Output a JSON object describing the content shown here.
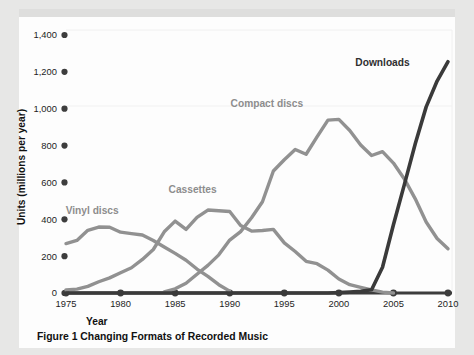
{
  "figure": {
    "caption_label": "Figure 1",
    "caption_text": "Changing Formats of Recorded Music",
    "caption_full": "Figure 1  Changing Formats of Recorded Music"
  },
  "colors": {
    "page_background": "#e7e7e6",
    "card_background": "#fdfdfd",
    "gray_series": "#919191",
    "dark_series": "#3a3a3a",
    "axis": "#3d3d3d",
    "label_gray": "#8d8d8d",
    "label_dark": "#2f2f2f",
    "text": "#1d1d1d",
    "gridline": "#ececec"
  },
  "chart_data": {
    "type": "line",
    "title": "Figure 1  Changing Formats of Recorded Music",
    "xlabel": "Year",
    "ylabel": "Units (millions per year)",
    "xlim": [
      1975,
      2010
    ],
    "ylim": [
      0,
      1400
    ],
    "xticks": [
      1975,
      1980,
      1985,
      1990,
      1995,
      2000,
      2005,
      2010
    ],
    "xtick_labels": [
      "1975",
      "1980",
      "1985",
      "1990",
      "1995",
      "2000",
      "2005",
      "2010"
    ],
    "yticks": [
      0,
      200,
      400,
      600,
      800,
      1000,
      1200,
      1400
    ],
    "ytick_labels": [
      "0",
      "200",
      "400",
      "600",
      "800",
      "1,000",
      "1,200",
      "1,400"
    ],
    "grid": false,
    "legend": "inline-labels",
    "series": [
      {
        "name": "Vinyl discs",
        "color": "#919191",
        "label_x": 1977.4,
        "label_y": 430,
        "x": [
          1975,
          1976,
          1977,
          1978,
          1979,
          1980,
          1981,
          1982,
          1983,
          1984,
          1985,
          1986,
          1987,
          1988,
          1989,
          1990
        ],
        "values": [
          268,
          285,
          340,
          358,
          357,
          330,
          322,
          315,
          285,
          250,
          215,
          178,
          130,
          90,
          45,
          10
        ]
      },
      {
        "name": "Cassettes",
        "color": "#919191",
        "label_x": 1986.6,
        "label_y": 545,
        "x": [
          1975,
          1976,
          1977,
          1978,
          1979,
          1980,
          1981,
          1982,
          1983,
          1984,
          1985,
          1986,
          1987,
          1988,
          1989,
          1990,
          1991,
          1992,
          1993,
          1994,
          1995,
          1996,
          1997,
          1998,
          1999,
          2000,
          2001,
          2002,
          2003,
          2004,
          2005
        ],
        "values": [
          16,
          21,
          36,
          61,
          82,
          110,
          137,
          182,
          236,
          332,
          390,
          345,
          410,
          450,
          446,
          442,
          366,
          336,
          339,
          345,
          272,
          225,
          172,
          159,
          124,
          76,
          45,
          31,
          17,
          5,
          0
        ]
      },
      {
        "name": "Compact discs",
        "color": "#919191",
        "label_x": 1993.4,
        "label_y": 1010,
        "x": [
          1984,
          1985,
          1986,
          1987,
          1988,
          1989,
          1990,
          1991,
          1992,
          1993,
          1994,
          1995,
          1996,
          1997,
          1998,
          1999,
          2000,
          2001,
          2002,
          2003,
          2004,
          2005,
          2006,
          2007,
          2008,
          2009,
          2010
        ],
        "values": [
          6,
          23,
          53,
          102,
          150,
          207,
          287,
          333,
          408,
          495,
          662,
          723,
          779,
          753,
          847,
          938,
          942,
          882,
          803,
          746,
          767,
          705,
          619,
          511,
          385,
          296,
          240
        ]
      },
      {
        "name": "Downloads",
        "color": "#3a3a3a",
        "label_x": 2004.0,
        "label_y": 1232,
        "x": [
          1975,
          1999,
          2000,
          2001,
          2002,
          2003,
          2004,
          2005,
          2006,
          2007,
          2008,
          2009,
          2010
        ],
        "values": [
          0,
          0,
          2,
          5,
          9,
          18,
          140,
          370,
          588,
          810,
          1010,
          1150,
          1255
        ]
      }
    ]
  }
}
